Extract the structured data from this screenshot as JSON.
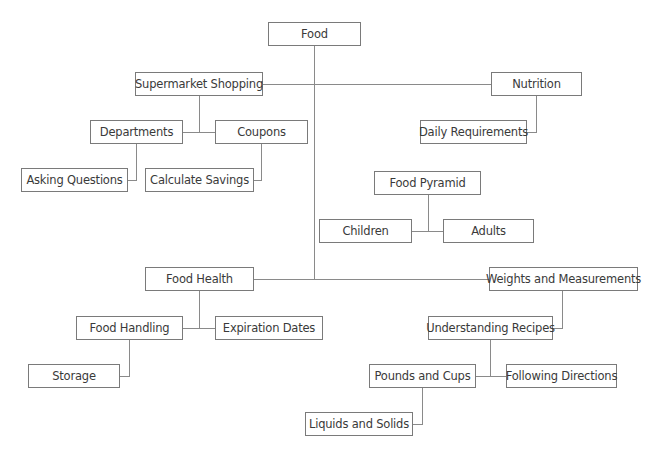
{
  "diagram": {
    "title": "Food",
    "nodes": [
      {
        "id": "food",
        "label": "Food",
        "x": 268,
        "y": 22,
        "w": 93,
        "h": 24
      },
      {
        "id": "supermarket",
        "label": "Supermarket Shopping",
        "x": 135,
        "y": 72,
        "w": 128,
        "h": 24
      },
      {
        "id": "nutrition",
        "label": "Nutrition",
        "x": 491,
        "y": 72,
        "w": 91,
        "h": 24
      },
      {
        "id": "departments",
        "label": "Departments",
        "x": 90,
        "y": 120,
        "w": 93,
        "h": 24
      },
      {
        "id": "coupons",
        "label": "Coupons",
        "x": 215,
        "y": 120,
        "w": 93,
        "h": 24
      },
      {
        "id": "daily_requirements",
        "label": "Daily Requirements",
        "x": 420,
        "y": 120,
        "w": 107,
        "h": 24
      },
      {
        "id": "asking_questions",
        "label": "Asking Questions",
        "x": 21,
        "y": 168,
        "w": 107,
        "h": 24
      },
      {
        "id": "calculate_savings",
        "label": "Calculate Savings",
        "x": 145,
        "y": 168,
        "w": 109,
        "h": 24
      },
      {
        "id": "food_pyramid",
        "label": "Food Pyramid",
        "x": 374,
        "y": 171,
        "w": 107,
        "h": 24
      },
      {
        "id": "children",
        "label": "Children",
        "x": 319,
        "y": 219,
        "w": 93,
        "h": 24
      },
      {
        "id": "adults",
        "label": "Adults",
        "x": 443,
        "y": 219,
        "w": 91,
        "h": 24
      },
      {
        "id": "food_health",
        "label": "Food Health",
        "x": 145,
        "y": 267,
        "w": 109,
        "h": 24
      },
      {
        "id": "weights",
        "label": "Weights and Measurements",
        "x": 489,
        "y": 267,
        "w": 149,
        "h": 24
      },
      {
        "id": "food_handling",
        "label": "Food Handling",
        "x": 76,
        "y": 316,
        "w": 107,
        "h": 24
      },
      {
        "id": "expiration_dates",
        "label": "Expiration Dates",
        "x": 215,
        "y": 316,
        "w": 108,
        "h": 24
      },
      {
        "id": "understanding_recipes",
        "label": "Understanding Recipes",
        "x": 428,
        "y": 316,
        "w": 125,
        "h": 24
      },
      {
        "id": "storage",
        "label": "Storage",
        "x": 28,
        "y": 364,
        "w": 92,
        "h": 24
      },
      {
        "id": "pounds_cups",
        "label": "Pounds and Cups",
        "x": 369,
        "y": 364,
        "w": 107,
        "h": 24
      },
      {
        "id": "following_directions",
        "label": "Following Directions",
        "x": 506,
        "y": 364,
        "w": 111,
        "h": 24
      },
      {
        "id": "liquids_solids",
        "label": "Liquids and Solids",
        "x": 305,
        "y": 412,
        "w": 108,
        "h": 24
      }
    ],
    "edges": [
      {
        "from": "food",
        "to": "supermarket"
      },
      {
        "from": "food",
        "to": "nutrition"
      },
      {
        "from": "food",
        "to": "food_health"
      },
      {
        "from": "food",
        "to": "weights"
      },
      {
        "from": "supermarket",
        "to": "departments"
      },
      {
        "from": "supermarket",
        "to": "coupons"
      },
      {
        "from": "departments",
        "to": "asking_questions"
      },
      {
        "from": "coupons",
        "to": "calculate_savings"
      },
      {
        "from": "nutrition",
        "to": "daily_requirements"
      },
      {
        "from": "food_pyramid",
        "to": "children"
      },
      {
        "from": "food_pyramid",
        "to": "adults"
      },
      {
        "from": "food_health",
        "to": "food_handling"
      },
      {
        "from": "food_health",
        "to": "expiration_dates"
      },
      {
        "from": "food_handling",
        "to": "storage"
      },
      {
        "from": "weights",
        "to": "understanding_recipes"
      },
      {
        "from": "understanding_recipes",
        "to": "pounds_cups"
      },
      {
        "from": "understanding_recipes",
        "to": "following_directions"
      },
      {
        "from": "pounds_cups",
        "to": "liquids_solids"
      }
    ],
    "lines": [
      {
        "x": 314,
        "y": 46,
        "w": 1,
        "h": 233
      },
      {
        "x": 263,
        "y": 84,
        "w": 228,
        "h": 1
      },
      {
        "x": 254,
        "y": 279,
        "w": 235,
        "h": 1
      },
      {
        "x": 199,
        "y": 96,
        "w": 1,
        "h": 36
      },
      {
        "x": 183,
        "y": 132,
        "w": 32,
        "h": 1
      },
      {
        "x": 136,
        "y": 144,
        "w": 1,
        "h": 36
      },
      {
        "x": 128,
        "y": 180,
        "w": 9,
        "h": 1
      },
      {
        "x": 261,
        "y": 144,
        "w": 1,
        "h": 36
      },
      {
        "x": 254,
        "y": 180,
        "w": 8,
        "h": 1
      },
      {
        "x": 536,
        "y": 96,
        "w": 1,
        "h": 36
      },
      {
        "x": 527,
        "y": 132,
        "w": 10,
        "h": 1
      },
      {
        "x": 428,
        "y": 195,
        "w": 1,
        "h": 36
      },
      {
        "x": 412,
        "y": 231,
        "w": 31,
        "h": 1
      },
      {
        "x": 199,
        "y": 291,
        "w": 1,
        "h": 37
      },
      {
        "x": 183,
        "y": 328,
        "w": 32,
        "h": 1
      },
      {
        "x": 129,
        "y": 340,
        "w": 1,
        "h": 36
      },
      {
        "x": 120,
        "y": 376,
        "w": 10,
        "h": 1
      },
      {
        "x": 562,
        "y": 291,
        "w": 1,
        "h": 37
      },
      {
        "x": 553,
        "y": 328,
        "w": 10,
        "h": 1
      },
      {
        "x": 490,
        "y": 340,
        "w": 1,
        "h": 36
      },
      {
        "x": 476,
        "y": 376,
        "w": 30,
        "h": 1
      },
      {
        "x": 422,
        "y": 388,
        "w": 1,
        "h": 36
      },
      {
        "x": 413,
        "y": 424,
        "w": 10,
        "h": 1
      }
    ]
  },
  "colors": {
    "line": "#8a8a8a",
    "border": "#7a7a7a",
    "text": "#3a3a3a",
    "background": "#ffffff"
  }
}
